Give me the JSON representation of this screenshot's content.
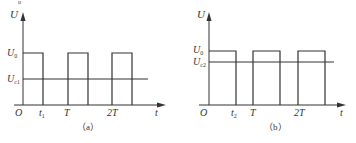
{
  "figure_marker": "u",
  "panels": [
    {
      "id": "a",
      "caption": "（a）",
      "y_axis_label": "U",
      "x_axis_label": "t",
      "origin_label": "O",
      "high_level_label": "U",
      "high_level_sub": "0",
      "threshold_label": "U",
      "threshold_sub": "c1",
      "x_ticks": [
        {
          "main": "t",
          "sub": "1"
        },
        {
          "main": "T",
          "sub": ""
        },
        {
          "main": "2T",
          "sub": ""
        }
      ],
      "waveform": "square pulse train, high level U0 from 0 to t1, repeating each period T",
      "pulses": [
        [
          0,
          "t1"
        ],
        [
          "T",
          "T+t1"
        ],
        [
          "2T",
          "2T+t1"
        ]
      ]
    },
    {
      "id": "b",
      "caption": "（b）",
      "y_axis_label": "U",
      "x_axis_label": "t",
      "origin_label": "O",
      "high_level_label": "U",
      "high_level_sub": "0",
      "threshold_label": "U",
      "threshold_sub": "c2",
      "x_ticks": [
        {
          "main": "t",
          "sub": "2"
        },
        {
          "main": "T",
          "sub": ""
        },
        {
          "main": "2T",
          "sub": ""
        }
      ],
      "waveform": "square pulse train, high level U0 from 0 to t2, repeating each period T",
      "pulses": [
        [
          0,
          "t2"
        ],
        [
          "T",
          "T+t2"
        ],
        [
          "2T",
          "2T+t2"
        ]
      ]
    }
  ],
  "colors": {
    "line": "#333333",
    "text": "#333333",
    "background": "#ffffff"
  }
}
